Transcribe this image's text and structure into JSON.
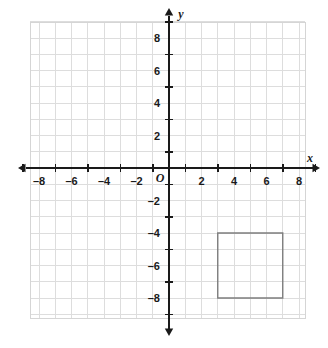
{
  "figure": {
    "kind": "coordinate-plane",
    "width": 328,
    "height": 348,
    "background_color": "#ffffff"
  },
  "chart_data": {
    "type": "scatter",
    "title": "",
    "xlabel": "x",
    "ylabel": "y",
    "xlim": [
      -9,
      9
    ],
    "ylim": [
      -9,
      9
    ],
    "grid": true,
    "grid_step": 1,
    "tick_step": 2,
    "x_tick_values": [
      -8,
      -6,
      -4,
      -2,
      2,
      4,
      6,
      8
    ],
    "y_tick_values": [
      8,
      6,
      4,
      2,
      -2,
      -4,
      -6,
      -8
    ],
    "x_tick_labels": [
      "–8",
      "–6",
      "–4",
      "–2",
      "2",
      "4",
      "6",
      "8"
    ],
    "y_tick_labels": [
      "8",
      "6",
      "4",
      "2",
      "–2",
      "–4",
      "–6",
      "–8"
    ],
    "origin_label": "O",
    "legend": null,
    "annotations": [],
    "shapes": [
      {
        "name": "square",
        "kind": "polygon",
        "closed": true,
        "stroke": "#7d7d7d",
        "fill": "none",
        "stroke_width": 1.4,
        "vertices": [
          {
            "x": 3,
            "y": -4
          },
          {
            "x": 7,
            "y": -4
          },
          {
            "x": 7,
            "y": -8
          },
          {
            "x": 3,
            "y": -8
          }
        ],
        "side_length": 4
      }
    ]
  },
  "style": {
    "grid_color": "#dddddd",
    "grid_border_color": "#d5d5d5",
    "axis_color": "#1a1a1a",
    "tick_color": "#1a1a1a",
    "shape_color": "#7d7d7d",
    "label_color": "#1a1a1a"
  },
  "geometry": {
    "origin_px": {
      "x": 169,
      "y": 168
    },
    "unit_px": 16.25,
    "grid_rect_px": {
      "left": 30,
      "top": 22,
      "right": 305,
      "bottom": 318
    },
    "x_axis_px": {
      "start": 18,
      "end": 320
    },
    "y_axis_px": {
      "start": 8,
      "end": 336
    }
  },
  "labels": {
    "x_axis_name": "x",
    "y_axis_name": "y"
  }
}
